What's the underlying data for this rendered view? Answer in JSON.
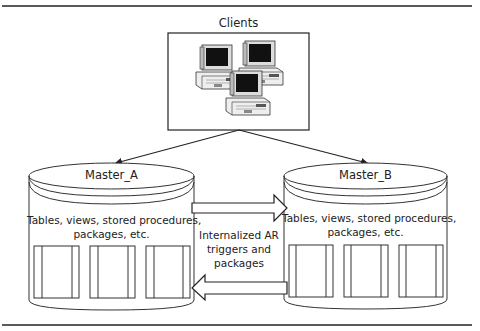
{
  "diagram": {
    "clients": {
      "label": "Clients",
      "icon": "computer-workstations-icon",
      "count": 3
    },
    "master_a": {
      "label": "Master_A",
      "contents_line1": "Tables, views, stored procedures,",
      "contents_line2": "packages, etc.",
      "object_count": 3
    },
    "master_b": {
      "label": "Master_B",
      "contents_line1": "Tables, views, stored procedures,",
      "contents_line2": "packages, etc.",
      "object_count": 3
    },
    "replication": {
      "line1": "Internalized AR",
      "line2": "triggers and",
      "line3": "packages"
    },
    "colors": {
      "stroke": "#222222",
      "background": "#ffffff",
      "screen": "#111111"
    }
  }
}
